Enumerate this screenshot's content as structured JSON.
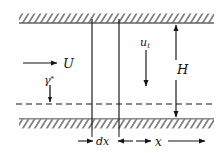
{
  "figure": {
    "type": "schematic-diagram",
    "width": 223,
    "height": 153,
    "background_color": "#ffffff",
    "line_color": "#141414"
  },
  "labels": {
    "inflow_velocity": "U",
    "shear_rate": "γ",
    "shear_rate_superscript": "*",
    "wall_velocity": "u",
    "wall_velocity_subscript": "t",
    "gap_height": "H",
    "element_width": "dx",
    "axial_coordinate": "x"
  },
  "geometry": {
    "top_wall_y": 23,
    "bottom_wall_y": 119,
    "centerline_y": 104,
    "wall_left_x": 19,
    "wall_right_x": 214,
    "element_left_x": 92,
    "element_right_x": 119,
    "dimension_right_x": 176,
    "hatch_band_height": 9
  },
  "annotations": {
    "inflow_arrow": "horizontal-right-arrow",
    "shear_arrow": "short-down-arrow",
    "wall_velocity_arrow": "long-down-arrow",
    "height_dimension": "double-headed-vertical-arrow",
    "dx_dimension": "inward-pointing-horizontal-arrows",
    "x_dimension": "outward-pointing-horizontal-arrows",
    "centerline_style": "dashed"
  }
}
